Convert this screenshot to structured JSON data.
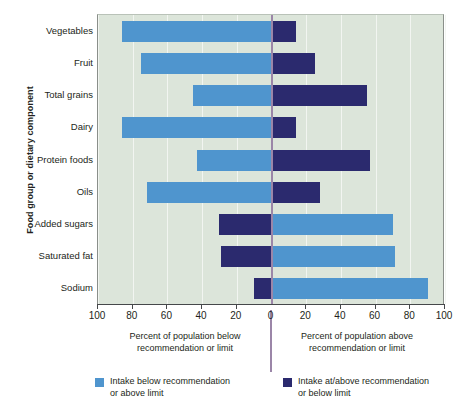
{
  "chart_data": {
    "type": "bar",
    "subtype": "diverging-horizontal-stacked",
    "title": "",
    "xlabel_left": "Percent of population below\nrecommendation or limit",
    "xlabel_right": "Percent of population above\nrecommendation or limit",
    "ylabel": "Food group or dietary component",
    "xlim": [
      -100,
      100
    ],
    "xticks": [
      {
        "label": "100",
        "value": -100
      },
      {
        "label": "80",
        "value": -80
      },
      {
        "label": "60",
        "value": -60
      },
      {
        "label": "40",
        "value": -40
      },
      {
        "label": "20",
        "value": -20
      },
      {
        "label": "0",
        "value": 0
      },
      {
        "label": "20",
        "value": 20
      },
      {
        "label": "40",
        "value": 40
      },
      {
        "label": "60",
        "value": 60
      },
      {
        "label": "80",
        "value": 80
      },
      {
        "label": "100",
        "value": 100
      }
    ],
    "grid": true,
    "categories": [
      "Vegetables",
      "Fruit",
      "Total grains",
      "Dairy",
      "Protein foods",
      "Oils",
      "Added sugars",
      "Saturated fat",
      "Sodium"
    ],
    "series": [
      {
        "name": "Intake below recommendation or above limit",
        "color": "#4f95ce",
        "values": [
          86,
          75,
          45,
          86,
          43,
          72,
          70,
          71,
          90
        ]
      },
      {
        "name": "Intake at/above recommendation or below limit",
        "color": "#2b2a6e",
        "values": [
          14,
          25,
          55,
          14,
          57,
          28,
          30,
          29,
          10
        ]
      }
    ],
    "bars": [
      {
        "category": "Vegetables",
        "left_series": "light",
        "left_value": 86,
        "right_series": "dark",
        "right_value": 14
      },
      {
        "category": "Fruit",
        "left_series": "light",
        "left_value": 75,
        "right_series": "dark",
        "right_value": 25
      },
      {
        "category": "Total grains",
        "left_series": "light",
        "left_value": 45,
        "right_series": "dark",
        "right_value": 55
      },
      {
        "category": "Dairy",
        "left_series": "light",
        "left_value": 86,
        "right_series": "dark",
        "right_value": 14
      },
      {
        "category": "Protein foods",
        "left_series": "light",
        "left_value": 43,
        "right_series": "dark",
        "right_value": 57
      },
      {
        "category": "Oils",
        "left_series": "light",
        "left_value": 72,
        "right_series": "dark",
        "right_value": 28
      },
      {
        "category": "Added sugars",
        "left_series": "dark",
        "left_value": 30,
        "right_series": "light",
        "right_value": 70
      },
      {
        "category": "Saturated fat",
        "left_series": "dark",
        "left_value": 29,
        "right_series": "light",
        "right_value": 71
      },
      {
        "category": "Sodium",
        "left_series": "dark",
        "left_value": 10,
        "right_series": "light",
        "right_value": 90
      }
    ],
    "legend": {
      "position": "bottom",
      "entries": [
        {
          "label": "Intake below recommendation\nor above limit",
          "color": "#4f95ce",
          "swatch": "light"
        },
        {
          "label": "Intake at/above recommendation\nor below limit",
          "color": "#2b2a6e",
          "swatch": "dark"
        }
      ]
    },
    "colors": {
      "light_blue": "#4f95ce",
      "dark_navy": "#2b2a6e",
      "plot_background": "#dce5da",
      "gridline": "#f2f5f1",
      "zero_line": "#9b86a8",
      "axis": "#45484a",
      "text": "#231f20"
    }
  }
}
